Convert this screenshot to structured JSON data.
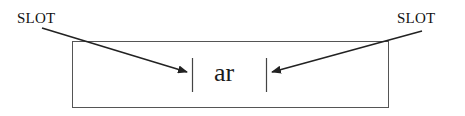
{
  "diagram": {
    "labels": {
      "left_slot": "SLOT",
      "right_slot": "SLOT"
    },
    "center_text": "ar",
    "shapes": {
      "outer_box": {
        "x": 72,
        "y": 41,
        "width": 316,
        "height": 66
      },
      "left_bar": {
        "x": 192,
        "y1": 58,
        "y2": 92
      },
      "right_bar": {
        "x": 266,
        "y1": 58,
        "y2": 92
      }
    },
    "arrows": [
      {
        "from": "left_slot",
        "to": "left_bar",
        "x1": 42,
        "y1": 28,
        "x2": 187,
        "y2": 72
      },
      {
        "from": "right_slot",
        "to": "right_bar",
        "x1": 422,
        "y1": 31,
        "x2": 272,
        "y2": 72
      }
    ],
    "colors": {
      "stroke": "#333333",
      "text": "#111111",
      "background": "#ffffff"
    }
  }
}
